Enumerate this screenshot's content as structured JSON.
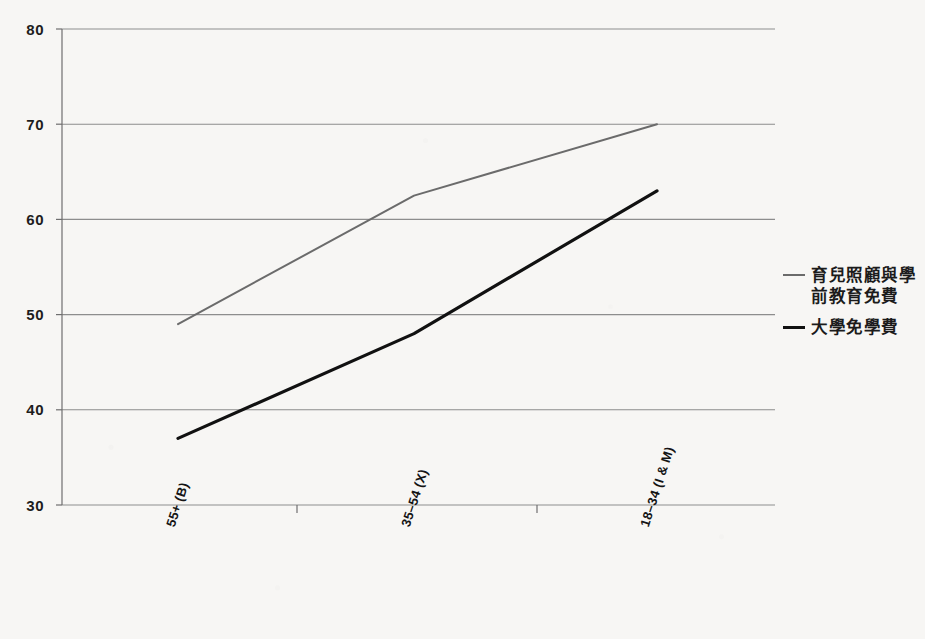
{
  "chart_data": {
    "type": "line",
    "title": "",
    "xlabel": "",
    "ylabel": "",
    "categories": [
      "55+ (B)",
      "35–54 (X)",
      "18–34 (I & M)"
    ],
    "ylim": [
      30,
      80
    ],
    "yticks": [
      30,
      40,
      50,
      60,
      70,
      80
    ],
    "ytick_labels": [
      "30",
      "40",
      "50",
      "60",
      "70",
      "80"
    ],
    "grid": true,
    "legend_position": "right",
    "series": [
      {
        "name": "育兒照顧與學前教育免費",
        "values": [
          49,
          62.5,
          70
        ],
        "color": "#6b6b6b",
        "width": 2
      },
      {
        "name": "大學免學費",
        "values": [
          37,
          48,
          63
        ],
        "color": "#111111",
        "width": 3.2
      }
    ]
  },
  "legend": {
    "entries": [
      {
        "label_line1": "育兒照顧與學",
        "label_line2": "前教育免費",
        "color": "#6b6b6b"
      },
      {
        "label_line1": "大學免學費",
        "label_line2": "",
        "color": "#111111"
      }
    ]
  },
  "axes": {
    "y_tick_0": "30",
    "y_tick_1": "40",
    "y_tick_2": "50",
    "y_tick_3": "60",
    "y_tick_4": "70",
    "y_tick_5": "80",
    "x_tick_0": "55+ (B)",
    "x_tick_1": "35–54 (X)",
    "x_tick_2": "18–34 (I & M)"
  },
  "colors": {
    "background": "#f7f6f4",
    "grid": "#8d8d8d",
    "axis": "#6f6f6f",
    "series_light": "#6b6b6b",
    "series_dark": "#111111",
    "text": "#1b1b1b"
  }
}
